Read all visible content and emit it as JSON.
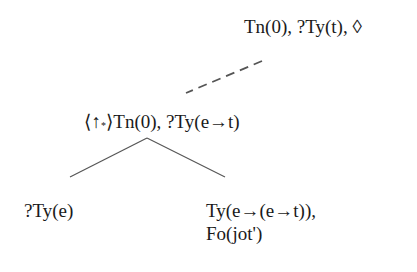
{
  "diagram": {
    "type": "tree",
    "nodes": {
      "root": {
        "label": "Tn(0), ?Ty(t), ◊"
      },
      "unfixed": {
        "arrow": "⟨↑",
        "star": "*",
        "rest": "⟩Tn(0), ?Ty(e→t)"
      },
      "left_child": {
        "label": "?Ty(e)"
      },
      "right_child": {
        "line1": "Ty(e→(e→t)),",
        "line2": "Fo(jot')"
      }
    },
    "edges": [
      {
        "from": "root",
        "to": "unfixed",
        "style": "dashed"
      },
      {
        "from": "unfixed",
        "to": "left_child",
        "style": "solid"
      },
      {
        "from": "unfixed",
        "to": "right_child",
        "style": "solid"
      }
    ],
    "colors": {
      "text": "#1a1a1a",
      "line": "#555555",
      "background": "#ffffff"
    }
  }
}
